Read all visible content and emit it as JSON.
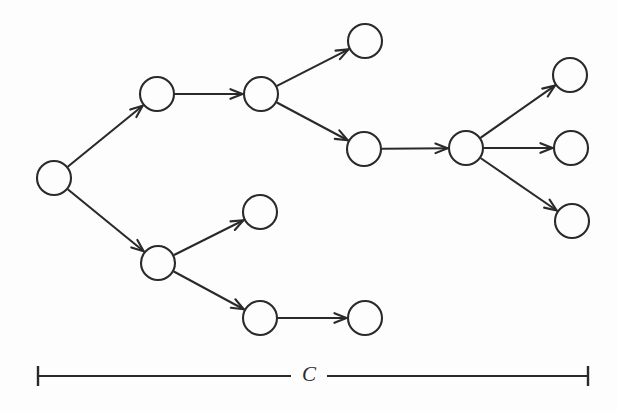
{
  "figure": {
    "type": "directed-tree-diagram",
    "background_color": "#fdfdfd",
    "stroke_color": "#2a2a2a",
    "width": 617,
    "height": 412
  },
  "graph": {
    "node_radius": 17,
    "nodes": [
      {
        "id": "n0",
        "name": "root-node",
        "cx": 54,
        "cy": 178
      },
      {
        "id": "n1",
        "name": "upper-level1-node",
        "cx": 157,
        "cy": 94
      },
      {
        "id": "n2",
        "name": "upper-level2-node",
        "cx": 261,
        "cy": 94
      },
      {
        "id": "n3",
        "name": "upper-leaf-node",
        "cx": 365,
        "cy": 41
      },
      {
        "id": "n4",
        "name": "upper-level3-node",
        "cx": 364,
        "cy": 149
      },
      {
        "id": "n5",
        "name": "hub-node",
        "cx": 466,
        "cy": 148
      },
      {
        "id": "n6",
        "name": "right-top-leaf-node",
        "cx": 570,
        "cy": 75
      },
      {
        "id": "n7",
        "name": "right-middle-leaf-node",
        "cx": 571,
        "cy": 148
      },
      {
        "id": "n8",
        "name": "right-bottom-leaf-node",
        "cx": 572,
        "cy": 221
      },
      {
        "id": "n9",
        "name": "lower-level1-node",
        "cx": 158,
        "cy": 263
      },
      {
        "id": "n10",
        "name": "lower-upper-leaf-node",
        "cx": 260,
        "cy": 212
      },
      {
        "id": "n11",
        "name": "lower-level2-node",
        "cx": 260,
        "cy": 318
      },
      {
        "id": "n12",
        "name": "lower-leaf-node",
        "cx": 365,
        "cy": 318
      }
    ],
    "edges": [
      {
        "name": "edge-root-to-upper-level1",
        "from": "n0",
        "to": "n1"
      },
      {
        "name": "edge-root-to-lower-level1",
        "from": "n0",
        "to": "n9"
      },
      {
        "name": "edge-upper-level1-to-level2",
        "from": "n1",
        "to": "n2"
      },
      {
        "name": "edge-upper-level2-to-leaf",
        "from": "n2",
        "to": "n3"
      },
      {
        "name": "edge-upper-level2-to-level3",
        "from": "n2",
        "to": "n4"
      },
      {
        "name": "edge-upper-level3-to-hub",
        "from": "n4",
        "to": "n5"
      },
      {
        "name": "edge-hub-to-right-top-leaf",
        "from": "n5",
        "to": "n6"
      },
      {
        "name": "edge-hub-to-right-middle-leaf",
        "from": "n5",
        "to": "n7"
      },
      {
        "name": "edge-hub-to-right-bottom-leaf",
        "from": "n5",
        "to": "n8"
      },
      {
        "name": "edge-lower-level1-to-upper-leaf",
        "from": "n9",
        "to": "n10"
      },
      {
        "name": "edge-lower-level1-to-level2",
        "from": "n9",
        "to": "n11"
      },
      {
        "name": "edge-lower-level2-to-leaf",
        "from": "n11",
        "to": "n12"
      }
    ]
  },
  "scale_bar": {
    "label": "C",
    "x_start": 38,
    "x_end": 588,
    "y": 376,
    "tick_half_height": 10,
    "label_x": 309,
    "label_y": 374
  }
}
